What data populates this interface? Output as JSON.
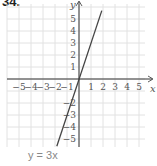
{
  "problem": {
    "number": "34."
  },
  "chart_data": {
    "type": "line",
    "title": "",
    "equation": "y = 3x",
    "xlabel": "x",
    "ylabel": "y",
    "xlim": [
      -6,
      5.5
    ],
    "ylim": [
      -6,
      6
    ],
    "x_ticks": [
      -5,
      -4,
      -3,
      -2,
      -1,
      1,
      2,
      3,
      4,
      5
    ],
    "y_ticks": [
      5,
      4,
      3,
      2,
      1,
      -2,
      -3,
      -4,
      -5
    ],
    "grid": true,
    "series": [
      {
        "name": "y = 3x",
        "x": [
          -1.85,
          1.9
        ],
        "y": [
          -5.6,
          5.7
        ],
        "color": "#444444"
      }
    ],
    "colors": {
      "grid": "#e2e2e2",
      "axis": "#333333",
      "line": "#444444",
      "label": "#555555"
    }
  }
}
